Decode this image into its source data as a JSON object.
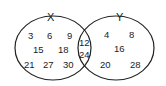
{
  "diagram": {
    "type": "venn",
    "sets": [
      {
        "label": "X",
        "only": [
          "3",
          "6",
          "9",
          "15",
          "18",
          "21",
          "27",
          "30"
        ]
      },
      {
        "label": "Y",
        "only": [
          "4",
          "8",
          "16",
          "20",
          "28"
        ]
      }
    ],
    "intersection": [
      "12",
      "24"
    ],
    "stroke_color": "#222222",
    "background": "#ffffff"
  }
}
